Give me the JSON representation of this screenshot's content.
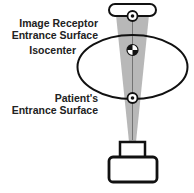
{
  "labels": {
    "receptor_line1": "Image Receptor",
    "receptor_line2": "Entrance Surface",
    "isocenter": "Isocenter",
    "patient_line1": "Patient's",
    "patient_line2": "Entrance Surface"
  },
  "colors": {
    "beam": "#b8b8b8",
    "outline": "#111111",
    "text": "#222222"
  }
}
